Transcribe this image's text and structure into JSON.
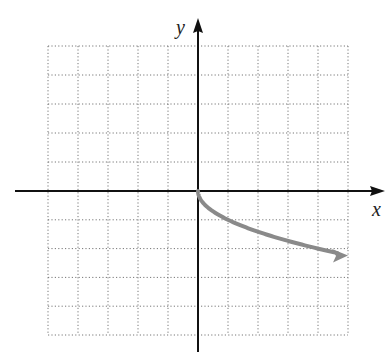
{
  "chart_data": {
    "type": "line",
    "title": "",
    "xlabel": "x",
    "ylabel": "y",
    "xlim": [
      -5,
      5
    ],
    "ylim": [
      -5,
      5
    ],
    "grid": true,
    "grid_style": "dotted",
    "series": [
      {
        "name": "y = -sqrt(x)",
        "color": "#8a8a8a",
        "x": [
          0,
          0.25,
          1,
          2,
          3,
          4,
          5
        ],
        "y": [
          0,
          -0.5,
          -1,
          -1.41,
          -1.73,
          -2,
          -2.24
        ],
        "end_arrow": true
      }
    ]
  },
  "axes": {
    "x_label": "x",
    "y_label": "y"
  },
  "colors": {
    "axis": "#111111",
    "grid": "#777777",
    "curve": "#8a8a8a"
  }
}
